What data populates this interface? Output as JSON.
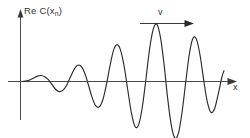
{
  "figure": {
    "title": "",
    "background_color": "#ffffff",
    "curve_color": "#2b2b2b",
    "axis_color": "#4a4a4a"
  },
  "labels": {
    "y_axis_main": "Re C(x",
    "y_axis_subscript": "n",
    "y_axis_close": ")",
    "x_axis": "x",
    "velocity": "v"
  },
  "icons": {
    "y_axis_arrow": "arrow-up-icon",
    "x_axis_arrow": "arrow-right-icon",
    "velocity_arrow": "arrow-right-icon"
  },
  "chart_data": {
    "type": "line",
    "title": "",
    "xlabel": "x",
    "ylabel": "Re C(x_n)",
    "grid": false,
    "legend": null,
    "annotations": [
      {
        "text": "v",
        "kind": "arrow-right",
        "meaning": "wave packet group velocity, pointing in +x direction",
        "x_start": 0.62,
        "x_end": 0.84,
        "y": 0.93
      }
    ],
    "axis": {
      "x_range": [
        0,
        1
      ],
      "y_range": [
        -1.05,
        1.05
      ],
      "x_ticks": [],
      "y_ticks": [],
      "baseline_y": 0
    },
    "series": [
      {
        "name": "Re C(x_n)",
        "x": [
          0.0,
          0.018,
          0.036,
          0.054,
          0.072,
          0.09,
          0.108,
          0.126,
          0.144,
          0.162,
          0.18,
          0.198,
          0.216,
          0.234,
          0.252,
          0.27,
          0.288,
          0.306,
          0.324,
          0.342,
          0.36,
          0.378,
          0.396,
          0.414,
          0.432,
          0.45,
          0.468,
          0.486,
          0.504,
          0.522,
          0.54,
          0.558,
          0.576,
          0.594,
          0.612,
          0.63,
          0.648,
          0.666,
          0.684,
          0.702,
          0.72,
          0.738,
          0.756,
          0.774,
          0.792,
          0.81,
          0.828,
          0.846,
          0.864,
          0.882,
          0.9,
          0.918,
          0.936,
          0.954,
          0.972,
          0.99,
          1.0
        ],
        "y": [
          0.0,
          0.01,
          0.03,
          0.06,
          0.09,
          0.1,
          0.08,
          0.03,
          -0.05,
          -0.13,
          -0.17,
          -0.15,
          -0.07,
          0.06,
          0.19,
          0.27,
          0.26,
          0.15,
          -0.04,
          -0.25,
          -0.4,
          -0.43,
          -0.32,
          -0.07,
          0.25,
          0.52,
          0.62,
          0.52,
          0.24,
          -0.16,
          -0.54,
          -0.76,
          -0.72,
          -0.42,
          0.05,
          0.55,
          0.88,
          0.96,
          0.74,
          0.28,
          -0.29,
          -0.74,
          -0.95,
          -0.86,
          -0.5,
          0.0,
          0.47,
          0.73,
          0.7,
          0.42,
          0.0,
          -0.36,
          -0.52,
          -0.45,
          -0.2,
          0.08,
          0.18
        ]
      }
    ]
  }
}
